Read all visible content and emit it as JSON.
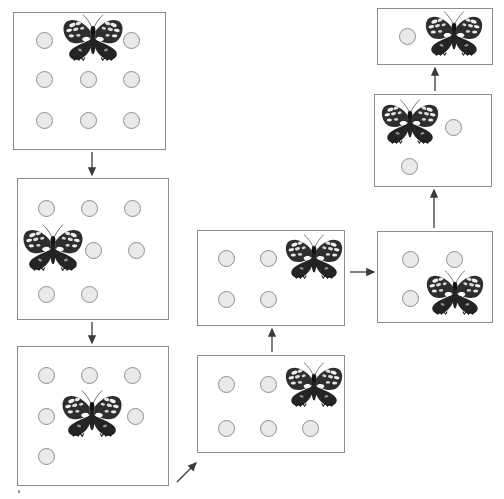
{
  "figure": {
    "colors": {
      "panel_border": "#8c8c8c",
      "panel_fill": "#ffffff",
      "circle_fill": "#e9e9e9",
      "circle_border": "#8f8f8f",
      "butterfly_dark": "#2b2b2b",
      "butterfly_light": "#f2f2f2",
      "arrow": "#3a3a3a",
      "background": "#ffffff"
    },
    "counts": {
      "panel_count": 8,
      "arrow_count": 7
    }
  },
  "panels": [
    {
      "id": "panel-1",
      "name": "panel-top-left",
      "grid": "3x3",
      "x": 13,
      "y": 12,
      "w": 153,
      "h": 138,
      "butterfly": {
        "x": 60,
        "y": 12,
        "w": 66,
        "h": 52
      },
      "circles": [
        {
          "x": 36,
          "y": 32
        },
        {
          "x": 123,
          "y": 32
        },
        {
          "x": 36,
          "y": 71
        },
        {
          "x": 80,
          "y": 71
        },
        {
          "x": 123,
          "y": 71
        },
        {
          "x": 36,
          "y": 112
        },
        {
          "x": 80,
          "y": 112
        },
        {
          "x": 123,
          "y": 112
        }
      ]
    },
    {
      "id": "panel-2",
      "name": "panel-middle-left",
      "grid": "3x3",
      "x": 17,
      "y": 178,
      "w": 152,
      "h": 142,
      "butterfly": {
        "x": 19,
        "y": 222,
        "w": 68,
        "h": 52
      },
      "circles": [
        {
          "x": 38,
          "y": 200
        },
        {
          "x": 81,
          "y": 200
        },
        {
          "x": 124,
          "y": 200
        },
        {
          "x": 85,
          "y": 242
        },
        {
          "x": 128,
          "y": 242
        },
        {
          "x": 38,
          "y": 286
        },
        {
          "x": 81,
          "y": 286
        }
      ]
    },
    {
      "id": "panel-3",
      "name": "panel-bottom-left",
      "grid": "3x3",
      "x": 17,
      "y": 346,
      "w": 152,
      "h": 140,
      "butterfly": {
        "x": 58,
        "y": 388,
        "w": 68,
        "h": 52
      },
      "circles": [
        {
          "x": 38,
          "y": 367
        },
        {
          "x": 81,
          "y": 367
        },
        {
          "x": 124,
          "y": 367
        },
        {
          "x": 38,
          "y": 408
        },
        {
          "x": 127,
          "y": 408
        },
        {
          "x": 38,
          "y": 448
        }
      ]
    },
    {
      "id": "panel-4",
      "name": "panel-bottom-center",
      "grid": "2x3",
      "x": 197,
      "y": 355,
      "w": 148,
      "h": 98,
      "butterfly": {
        "x": 283,
        "y": 360,
        "w": 62,
        "h": 50
      },
      "circles": [
        {
          "x": 218,
          "y": 376
        },
        {
          "x": 260,
          "y": 376
        },
        {
          "x": 218,
          "y": 420
        },
        {
          "x": 260,
          "y": 420
        },
        {
          "x": 302,
          "y": 420
        }
      ]
    },
    {
      "id": "panel-5",
      "name": "panel-middle-center",
      "grid": "2x3",
      "x": 197,
      "y": 230,
      "w": 148,
      "h": 96,
      "butterfly": {
        "x": 283,
        "y": 232,
        "w": 62,
        "h": 50
      },
      "circles": [
        {
          "x": 218,
          "y": 250
        },
        {
          "x": 260,
          "y": 250
        },
        {
          "x": 218,
          "y": 291
        },
        {
          "x": 260,
          "y": 291
        }
      ]
    },
    {
      "id": "panel-6",
      "name": "panel-middle-right",
      "grid": "2x2",
      "x": 377,
      "y": 231,
      "w": 116,
      "h": 92,
      "butterfly": {
        "x": 424,
        "y": 268,
        "w": 62,
        "h": 50
      },
      "circles": [
        {
          "x": 402,
          "y": 251
        },
        {
          "x": 446,
          "y": 251
        },
        {
          "x": 402,
          "y": 290
        }
      ]
    },
    {
      "id": "panel-7",
      "name": "panel-upper-right",
      "grid": "2x2",
      "x": 374,
      "y": 94,
      "w": 118,
      "h": 93,
      "butterfly": {
        "x": 379,
        "y": 97,
        "w": 62,
        "h": 50
      },
      "circles": [
        {
          "x": 445,
          "y": 119
        },
        {
          "x": 401,
          "y": 158
        }
      ]
    },
    {
      "id": "panel-8",
      "name": "panel-top-right",
      "grid": "1x2",
      "x": 377,
      "y": 8,
      "w": 116,
      "h": 57,
      "butterfly": {
        "x": 423,
        "y": 9,
        "w": 62,
        "h": 50
      },
      "circles": [
        {
          "x": 399,
          "y": 28
        }
      ]
    }
  ],
  "arrows": [
    {
      "id": "arrow-1",
      "name": "arrow-panel1-to-panel2",
      "kind": "vertical-down",
      "x1": 92,
      "y1": 152,
      "x2": 92,
      "y2": 175
    },
    {
      "id": "arrow-2",
      "name": "arrow-panel2-to-panel3",
      "kind": "vertical-down",
      "x1": 92,
      "y1": 322,
      "x2": 92,
      "y2": 343
    },
    {
      "id": "arrow-3",
      "name": "arrow-panel3-to-panel4",
      "kind": "diagonal-up-right",
      "x1": 177,
      "y1": 482,
      "x2": 196,
      "y2": 463
    },
    {
      "id": "arrow-4",
      "name": "arrow-panel4-to-panel5",
      "kind": "vertical-up",
      "x1": 272,
      "y1": 352,
      "x2": 272,
      "y2": 329
    },
    {
      "id": "arrow-5",
      "name": "arrow-panel5-to-panel6",
      "kind": "horizontal-right",
      "x1": 350,
      "y1": 272,
      "x2": 374,
      "y2": 272
    },
    {
      "id": "arrow-6",
      "name": "arrow-panel6-to-panel7",
      "kind": "vertical-up",
      "x1": 434,
      "y1": 228,
      "x2": 434,
      "y2": 190
    },
    {
      "id": "arrow-7",
      "name": "arrow-panel7-to-panel8",
      "kind": "vertical-up",
      "x1": 435,
      "y1": 91,
      "x2": 435,
      "y2": 68
    }
  ],
  "marks": [
    {
      "id": "mark-1",
      "name": "page-speck-bottom-left",
      "x": 18,
      "y": 490
    }
  ]
}
